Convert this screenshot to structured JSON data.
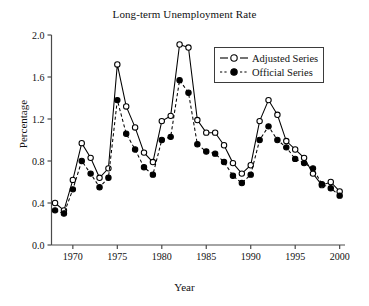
{
  "chart_data": {
    "type": "line",
    "title": "Long-term Unemployment Rate",
    "xlabel": "Year",
    "ylabel": "Percentage",
    "xlim": [
      1967.6,
      2000.6
    ],
    "ylim": [
      0.0,
      2.0
    ],
    "xticks": [
      1970,
      1975,
      1980,
      1985,
      1990,
      1995,
      2000
    ],
    "xtick_labels": [
      "1970",
      "1975",
      "1980",
      "1985",
      "1990",
      "1995",
      "2000"
    ],
    "yticks": [
      0.0,
      0.4,
      0.8,
      1.2,
      1.6,
      2.0
    ],
    "ytick_labels": [
      "0.0",
      "0.4",
      "0.8",
      "1.2",
      "1.6",
      "2.0"
    ],
    "grid": false,
    "legend_position": "upper right",
    "x": [
      1968,
      1969,
      1970,
      1971,
      1972,
      1973,
      1974,
      1975,
      1976,
      1977,
      1978,
      1979,
      1980,
      1981,
      1982,
      1983,
      1984,
      1985,
      1986,
      1987,
      1988,
      1989,
      1990,
      1991,
      1992,
      1993,
      1994,
      1995,
      1996,
      1997,
      1998,
      1999,
      2000
    ],
    "series": [
      {
        "name": "Adjusted Series",
        "marker": "open-circle",
        "linestyle": "solid",
        "color": "#000000",
        "values": [
          0.4,
          0.33,
          0.62,
          0.97,
          0.83,
          0.64,
          0.73,
          1.72,
          1.32,
          1.12,
          0.88,
          0.79,
          1.18,
          1.23,
          1.91,
          1.88,
          1.19,
          1.07,
          1.07,
          0.95,
          0.78,
          0.68,
          0.76,
          1.18,
          1.38,
          1.24,
          0.99,
          0.91,
          0.83,
          0.68,
          0.57,
          0.6,
          0.51
        ]
      },
      {
        "name": "Official Series",
        "marker": "filled-circle",
        "linestyle": "dashed",
        "color": "#000000",
        "values": [
          0.33,
          0.3,
          0.53,
          0.8,
          0.68,
          0.55,
          0.64,
          1.38,
          1.06,
          0.91,
          0.74,
          0.67,
          1.0,
          1.03,
          1.57,
          1.45,
          0.96,
          0.89,
          0.87,
          0.79,
          0.66,
          0.59,
          0.67,
          1.0,
          1.13,
          1.0,
          0.93,
          0.82,
          0.78,
          0.73,
          0.58,
          0.54,
          0.47
        ]
      }
    ]
  },
  "legend": {
    "items": [
      {
        "label": "Adjusted Series"
      },
      {
        "label": "Official Series"
      }
    ]
  }
}
